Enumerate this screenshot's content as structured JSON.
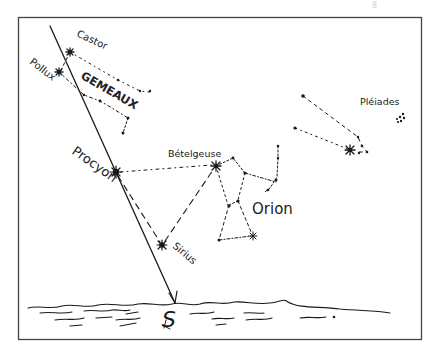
{
  "page_mark": "8",
  "labels": {
    "castor": "Castor",
    "pollux": "Pollux",
    "gemini": "GEMEAUX",
    "procyon": "Procyon",
    "betelgeuse": "Bételgeuse",
    "orion": "Orion",
    "sirius": "Sirius",
    "pleiades": "Pléiades",
    "south": "S"
  },
  "colors": {
    "ink": "#1a1a1a",
    "frame": "#444444",
    "background": "#ffffff"
  },
  "stars": [
    {
      "name": "Castor",
      "x": 70,
      "y": 52,
      "type": "asterisk"
    },
    {
      "name": "Pollux",
      "x": 59,
      "y": 72,
      "type": "asterisk"
    },
    {
      "name": "Procyon",
      "x": 116,
      "y": 172,
      "type": "bright"
    },
    {
      "name": "Sirius",
      "x": 162,
      "y": 245,
      "type": "bright"
    },
    {
      "name": "Betelgeuse",
      "x": 216,
      "y": 166,
      "type": "asterisk"
    },
    {
      "name": "Rigel",
      "x": 253,
      "y": 236,
      "type": "asterisk"
    },
    {
      "name": "Aldebaran",
      "x": 350,
      "y": 150,
      "type": "asterisk"
    }
  ],
  "frame": {
    "x": 18,
    "y": 17,
    "width": 403,
    "height": 322
  }
}
